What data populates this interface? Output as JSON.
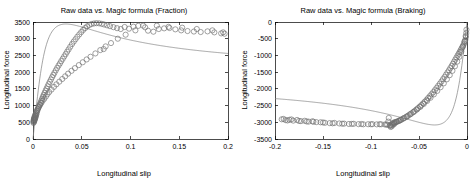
{
  "figure": {
    "background_color": "#ffffff",
    "marker_color": "#6e6e6e",
    "curve_color": "#808080",
    "axis_color": "#000000"
  },
  "chart_data": [
    {
      "type": "scatter",
      "id": "fraction",
      "title": "Raw data vs. Magic formula (Fraction)",
      "xlabel": "Longitudinal slip",
      "ylabel": "Longitudinal force",
      "xlim": [
        0,
        0.2
      ],
      "ylim": [
        0,
        3500
      ],
      "xticks": [
        0,
        0.05,
        0.1,
        0.15,
        0.2
      ],
      "xtick_labels": [
        "0",
        "0.05",
        "0.1",
        "0.15",
        "0.2"
      ],
      "yticks": [
        0,
        500,
        1000,
        1500,
        2000,
        2500,
        3000,
        3500
      ],
      "ytick_labels": [
        "0",
        "500",
        "1000",
        "1500",
        "2000",
        "2500",
        "3000",
        "3500"
      ],
      "grid": false,
      "legend": null,
      "series": [
        {
          "name": "Raw data",
          "marker": "circle",
          "x": [
            0.0005,
            0.0008,
            0.001,
            0.0012,
            0.0013,
            0.0015,
            0.0016,
            0.0018,
            0.002,
            0.0022,
            0.0024,
            0.0026,
            0.003,
            0.0034,
            0.0038,
            0.0042,
            0.0048,
            0.0055,
            0.0062,
            0.007,
            0.0078,
            0.0086,
            0.0094,
            0.0102,
            0.011,
            0.012,
            0.013,
            0.014,
            0.015,
            0.016,
            0.0172,
            0.0184,
            0.0196,
            0.0208,
            0.022,
            0.0234,
            0.0248,
            0.0262,
            0.0276,
            0.029,
            0.0305,
            0.032,
            0.0335,
            0.035,
            0.0365,
            0.0382,
            0.04,
            0.0418,
            0.0436,
            0.0455,
            0.0475,
            0.0495,
            0.0515,
            0.0535,
            0.0555,
            0.0578,
            0.06,
            0.0625,
            0.065,
            0.0678,
            0.0705,
            0.073,
            0.076,
            0.079,
            0.0825,
            0.0862,
            0.09,
            0.094,
            0.0985,
            0.103,
            0.108,
            0.113,
            0.118,
            0.1235,
            0.129,
            0.1345,
            0.14,
            0.146,
            0.152,
            0.1585,
            0.165,
            0.172,
            0.179,
            0.186,
            0.193,
            0.1965,
            0.0005,
            0.0007,
            0.0009,
            0.0011,
            0.0014,
            0.0017,
            0.0021,
            0.0027,
            0.0033,
            0.004,
            0.005,
            0.006,
            0.0072,
            0.0085,
            0.0098,
            0.0115,
            0.0132,
            0.0148,
            0.0166,
            0.019,
            0.0215,
            0.024,
            0.027,
            0.03,
            0.033,
            0.036,
            0.0395,
            0.043,
            0.047,
            0.051,
            0.055,
            0.059,
            0.064,
            0.069,
            0.0745,
            0.08,
            0.087,
            0.095,
            0.105,
            0.115,
            0.127,
            0.139,
            0.153,
            0.168,
            0.184,
            0.195,
            0.0725
          ],
          "y": [
            480,
            520,
            560,
            600,
            545,
            590,
            630,
            575,
            620,
            665,
            700,
            640,
            690,
            730,
            780,
            830,
            880,
            930,
            985,
            1040,
            1090,
            1150,
            1210,
            1265,
            1320,
            1385,
            1450,
            1510,
            1575,
            1640,
            1710,
            1780,
            1850,
            1915,
            1980,
            2055,
            2125,
            2195,
            2260,
            2330,
            2400,
            2470,
            2540,
            2610,
            2680,
            2760,
            2840,
            2915,
            2985,
            3060,
            3130,
            3200,
            3265,
            3320,
            3370,
            3410,
            3440,
            3455,
            3465,
            3460,
            3445,
            3425,
            3400,
            3375,
            3345,
            3315,
            3290,
            3350,
            3300,
            3360,
            3385,
            3390,
            3240,
            3210,
            3290,
            3310,
            3320,
            3280,
            3250,
            3230,
            3215,
            3200,
            3220,
            3190,
            3160,
            3150,
            530,
            570,
            505,
            615,
            655,
            600,
            710,
            745,
            800,
            855,
            905,
            960,
            1015,
            1075,
            1140,
            1200,
            1270,
            1340,
            1405,
            1480,
            1560,
            1635,
            1715,
            1795,
            1875,
            1955,
            2040,
            2120,
            2210,
            2295,
            2380,
            2460,
            2560,
            2660,
            2770,
            2870,
            3000,
            3120,
            3250,
            3340,
            3390,
            3355,
            3330,
            3290,
            3250,
            3190,
            2690
          ]
        },
        {
          "name": "Magic formula",
          "marker": "line",
          "curve": {
            "model": "magic-formula",
            "B": 52.0,
            "C": 1.62,
            "D": 3440.0,
            "E": 0.42
          }
        }
      ]
    },
    {
      "type": "scatter",
      "id": "braking",
      "title": "Raw data vs. Magic formula (Braking)",
      "xlabel": "Longitudinal slip",
      "ylabel": "Longitudinal force",
      "xlim": [
        -0.2,
        0
      ],
      "ylim": [
        -3500,
        0
      ],
      "xticks": [
        -0.2,
        -0.15,
        -0.1,
        -0.05,
        0
      ],
      "xtick_labels": [
        "-0.2",
        "-0.15",
        "-0.1",
        "-0.05",
        "0"
      ],
      "yticks": [
        -3500,
        -3000,
        -2500,
        -2000,
        -1500,
        -1000,
        -500,
        0
      ],
      "ytick_labels": [
        "-3500",
        "-3000",
        "-2500",
        "-2000",
        "-1500",
        "-1000",
        "-500",
        "0"
      ],
      "grid": false,
      "legend": null,
      "series": [
        {
          "name": "Raw data",
          "marker": "circle",
          "x": [
            -0.193,
            -0.189,
            -0.185,
            -0.181,
            -0.177,
            -0.173,
            -0.169,
            -0.165,
            -0.161,
            -0.157,
            -0.1525,
            -0.148,
            -0.143,
            -0.138,
            -0.133,
            -0.128,
            -0.123,
            -0.118,
            -0.113,
            -0.108,
            -0.103,
            -0.0985,
            -0.094,
            -0.0895,
            -0.0855,
            -0.083,
            -0.0815,
            -0.0805,
            -0.0795,
            -0.0788,
            -0.078,
            -0.0772,
            -0.0765,
            -0.0758,
            -0.075,
            -0.074,
            -0.0728,
            -0.0715,
            -0.07,
            -0.0685,
            -0.0668,
            -0.065,
            -0.0632,
            -0.0615,
            -0.0598,
            -0.058,
            -0.0562,
            -0.0545,
            -0.0528,
            -0.051,
            -0.0492,
            -0.0475,
            -0.0458,
            -0.044,
            -0.0422,
            -0.0405,
            -0.0388,
            -0.037,
            -0.0352,
            -0.0335,
            -0.0318,
            -0.03,
            -0.0283,
            -0.0266,
            -0.025,
            -0.0234,
            -0.0218,
            -0.0203,
            -0.0188,
            -0.0174,
            -0.016,
            -0.0147,
            -0.0134,
            -0.0122,
            -0.011,
            -0.0098,
            -0.0087,
            -0.0076,
            -0.0066,
            -0.0056,
            -0.0047,
            -0.0038,
            -0.003,
            -0.0023,
            -0.0017,
            -0.0012,
            -0.0008,
            -0.191,
            -0.187,
            -0.183,
            -0.175,
            -0.167,
            -0.16,
            -0.15,
            -0.14,
            -0.13,
            -0.12,
            -0.11,
            -0.1,
            -0.091,
            -0.084,
            -0.082,
            -0.08,
            -0.0785,
            -0.077,
            -0.0755,
            -0.0735,
            -0.071,
            -0.069,
            -0.066,
            -0.0625,
            -0.059,
            -0.0555,
            -0.052,
            -0.0485,
            -0.045,
            -0.0415,
            -0.038,
            -0.0345,
            -0.031,
            -0.0275,
            -0.0242,
            -0.021,
            -0.018,
            -0.0152,
            -0.0126,
            -0.0102,
            -0.008,
            -0.006,
            -0.0042,
            -0.0026,
            -0.0014,
            -0.0006
          ],
          "y": [
            -2910,
            -2935,
            -2925,
            -2950,
            -2930,
            -2965,
            -2955,
            -2980,
            -2970,
            -2995,
            -3000,
            -3015,
            -3025,
            -3020,
            -3035,
            -3040,
            -3050,
            -3045,
            -3055,
            -3060,
            -3058,
            -3055,
            -3062,
            -3060,
            -3065,
            -3070,
            -2870,
            -3090,
            -3140,
            -3075,
            -3035,
            -3080,
            -3010,
            -3050,
            -3000,
            -2990,
            -2975,
            -2960,
            -2940,
            -2920,
            -2895,
            -2865,
            -2835,
            -2805,
            -2770,
            -2735,
            -2700,
            -2660,
            -2620,
            -2575,
            -2530,
            -2485,
            -2435,
            -2385,
            -2330,
            -2275,
            -2220,
            -2160,
            -2100,
            -2040,
            -1975,
            -1910,
            -1845,
            -1780,
            -1710,
            -1645,
            -1575,
            -1510,
            -1445,
            -1380,
            -1315,
            -1250,
            -1185,
            -1125,
            -1065,
            -1005,
            -950,
            -895,
            -840,
            -790,
            -740,
            -690,
            -640,
            -590,
            -530,
            -450,
            -330,
            -2900,
            -2945,
            -2915,
            -2960,
            -2975,
            -2985,
            -3005,
            -3030,
            -3042,
            -3048,
            -3052,
            -3060,
            -3058,
            -3068,
            -2980,
            -3100,
            -3120,
            -3045,
            -3020,
            -2995,
            -2965,
            -2930,
            -2880,
            -2825,
            -2760,
            -2690,
            -2615,
            -2535,
            -2450,
            -2360,
            -2265,
            -2165,
            -2060,
            -1950,
            -1835,
            -1715,
            -1590,
            -1460,
            -1325,
            -1185,
            -1040,
            -890,
            -735,
            -580,
            -420,
            -230
          ]
        },
        {
          "name": "Magic formula",
          "marker": "line",
          "curve": {
            "model": "magic-formula",
            "B": 52.0,
            "C": 1.62,
            "D": 3080.0,
            "E": 0.42
          }
        }
      ]
    }
  ]
}
